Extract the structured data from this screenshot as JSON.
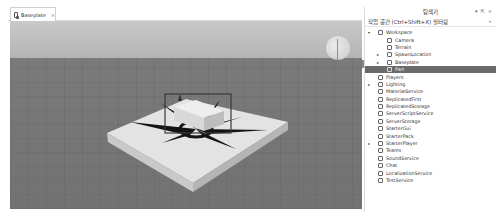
{
  "tabs": [
    {
      "label": "Baseplate",
      "icon": "place-icon",
      "close": "×"
    }
  ],
  "explorer": {
    "title": "탐색기",
    "controls": [
      "▾",
      "⇱",
      "×"
    ],
    "filter_placeholder": "작업 공간 (Ctrl+Shift+X) 필터링",
    "tree": [
      {
        "label": "Workspace",
        "depth": 0,
        "expander": "▾",
        "icon": "workspace-icon"
      },
      {
        "label": "Camera",
        "depth": 1,
        "expander": "",
        "icon": "camera-icon"
      },
      {
        "label": "Terrain",
        "depth": 1,
        "expander": "",
        "icon": "terrain-icon"
      },
      {
        "label": "SpawnLocation",
        "depth": 1,
        "expander": "▸",
        "icon": "spawn-location-icon"
      },
      {
        "label": "Baseplate",
        "depth": 1,
        "expander": "▸",
        "icon": "part-icon"
      },
      {
        "label": "Part",
        "depth": 1,
        "expander": "",
        "icon": "part-icon",
        "selected": true
      },
      {
        "label": "Players",
        "depth": 0,
        "expander": "",
        "icon": "players-icon"
      },
      {
        "label": "Lighting",
        "depth": 0,
        "expander": "▸",
        "icon": "lighting-icon"
      },
      {
        "label": "MaterialService",
        "depth": 0,
        "expander": "",
        "icon": "material-service-icon"
      },
      {
        "label": "ReplicatedFirst",
        "depth": 0,
        "expander": "",
        "icon": "replicated-first-icon"
      },
      {
        "label": "ReplicatedStorage",
        "depth": 0,
        "expander": "",
        "icon": "replicated-storage-icon"
      },
      {
        "label": "ServerScriptService",
        "depth": 0,
        "expander": "",
        "icon": "server-script-service-icon"
      },
      {
        "label": "ServerStorage",
        "depth": 0,
        "expander": "",
        "icon": "server-storage-icon"
      },
      {
        "label": "StarterGui",
        "depth": 0,
        "expander": "",
        "icon": "starter-gui-icon"
      },
      {
        "label": "StarterPack",
        "depth": 0,
        "expander": "",
        "icon": "starter-pack-icon"
      },
      {
        "label": "StarterPlayer",
        "depth": 0,
        "expander": "▸",
        "icon": "starter-player-icon"
      },
      {
        "label": "Teams",
        "depth": 0,
        "expander": "",
        "icon": "teams-icon"
      },
      {
        "label": "SoundService",
        "depth": 0,
        "expander": "",
        "icon": "sound-service-icon"
      },
      {
        "label": "Chat",
        "depth": 0,
        "expander": "",
        "icon": "chat-icon"
      },
      {
        "label": "LocalizationService",
        "depth": 0,
        "expander": "",
        "icon": "localization-service-icon"
      },
      {
        "label": "TestService",
        "depth": 0,
        "expander": "",
        "icon": "test-service-icon"
      }
    ]
  },
  "colors": {
    "selected_row": "#6a6a6a",
    "sky": "#c4c4c4",
    "ground": "#7a7a7a",
    "baseplate": "#e2e2e2",
    "selection_box": "#3a3a3a"
  }
}
